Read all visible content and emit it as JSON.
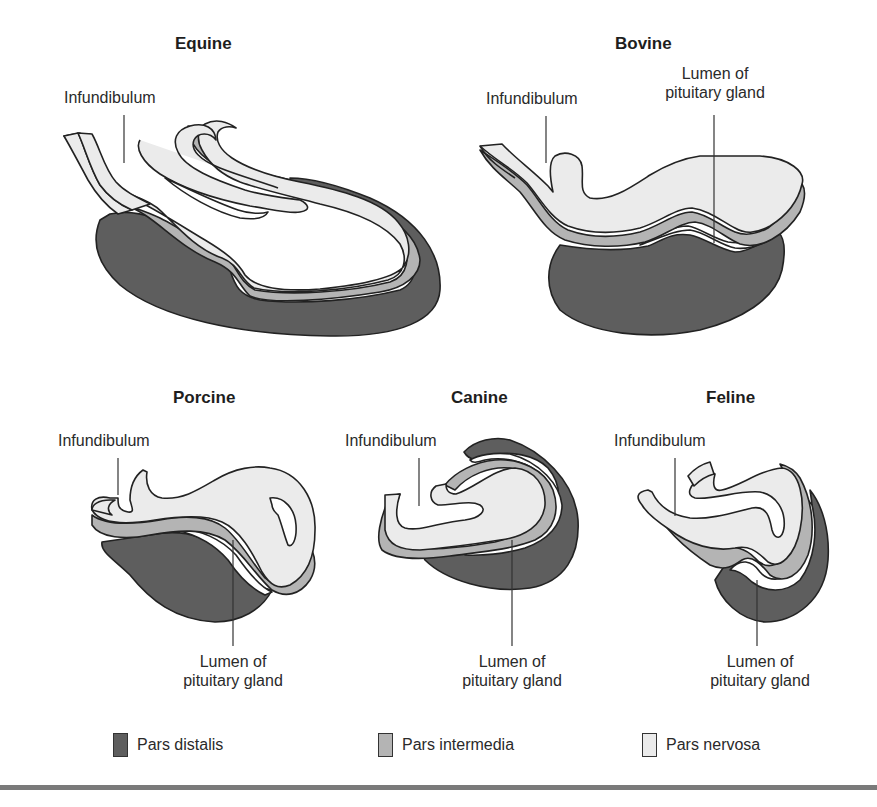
{
  "colors": {
    "pars_distalis": "#5e5e5e",
    "pars_intermedia": "#b4b4b4",
    "pars_nervosa": "#ebebeb",
    "lumen": "#ffffff",
    "outline": "#222222",
    "rule": "#7a7a7a"
  },
  "panels": {
    "equine": {
      "title": "Equine",
      "labels": {
        "infundibulum": "Infundibulum"
      }
    },
    "bovine": {
      "title": "Bovine",
      "labels": {
        "infundibulum": "Infundibulum",
        "lumen_line1": "Lumen of",
        "lumen_line2": "pituitary gland"
      }
    },
    "porcine": {
      "title": "Porcine",
      "labels": {
        "infundibulum": "Infundibulum",
        "lumen_line1": "Lumen of",
        "lumen_line2": "pituitary gland"
      }
    },
    "canine": {
      "title": "Canine",
      "labels": {
        "infundibulum": "Infundibulum",
        "lumen_line1": "Lumen of",
        "lumen_line2": "pituitary gland"
      }
    },
    "feline": {
      "title": "Feline",
      "labels": {
        "infundibulum": "Infundibulum",
        "lumen_line1": "Lumen of",
        "lumen_line2": "pituitary gland"
      }
    }
  },
  "legend": [
    {
      "key": "pars_distalis",
      "label": "Pars distalis"
    },
    {
      "key": "pars_intermedia",
      "label": "Pars intermedia"
    },
    {
      "key": "pars_nervosa",
      "label": "Pars nervosa"
    }
  ]
}
